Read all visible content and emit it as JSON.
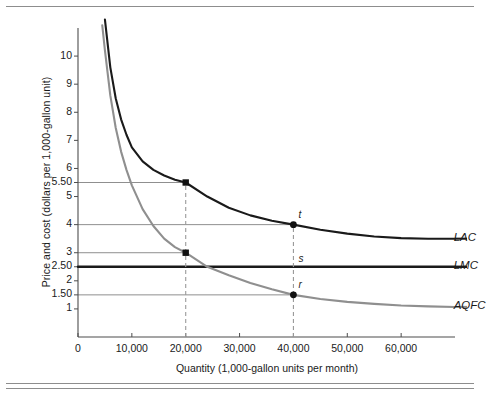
{
  "chart_data": {
    "type": "line",
    "title": "",
    "xlabel": "Quantity (1,000-gallon units per month)",
    "ylabel": "Price and cost (dollars per 1,000-gallon unit)",
    "xlim": [
      0,
      70000
    ],
    "ylim": [
      0,
      11
    ],
    "grid": false,
    "legend_position": "right-of-curves",
    "x_ticks": [
      "0",
      "10,000",
      "20,000",
      "30,000",
      "40,000",
      "50,000",
      "60,000"
    ],
    "x_tick_values": [
      0,
      10000,
      20000,
      30000,
      40000,
      50000,
      60000
    ],
    "y_ticks": [
      "1",
      "1.50",
      "2",
      "2.50",
      "3",
      "4",
      "5",
      "5.50",
      "6",
      "7",
      "8",
      "9",
      "10"
    ],
    "y_tick_values": [
      1,
      1.5,
      2,
      2.5,
      3,
      4,
      5,
      5.5,
      6,
      7,
      8,
      9,
      10
    ],
    "series": [
      {
        "name": "LAC",
        "label": "LAC",
        "color": "#1a1a1a",
        "width": 2.1,
        "points": [
          [
            5000,
            11.3
          ],
          [
            6000,
            9.6
          ],
          [
            7000,
            8.5
          ],
          [
            8000,
            7.75
          ],
          [
            9000,
            7.2
          ],
          [
            10000,
            6.75
          ],
          [
            12000,
            6.25
          ],
          [
            14000,
            5.95
          ],
          [
            16000,
            5.75
          ],
          [
            18000,
            5.6
          ],
          [
            20000,
            5.5
          ],
          [
            24000,
            5.0
          ],
          [
            28000,
            4.6
          ],
          [
            32000,
            4.33
          ],
          [
            36000,
            4.14
          ],
          [
            40000,
            4.0
          ],
          [
            45000,
            3.82
          ],
          [
            50000,
            3.68
          ],
          [
            55000,
            3.58
          ],
          [
            60000,
            3.52
          ],
          [
            65000,
            3.5
          ],
          [
            70000,
            3.5
          ]
        ]
      },
      {
        "name": "LMC",
        "label": "LMC",
        "color": "#1a1a1a",
        "width": 2.4,
        "points": [
          [
            0,
            2.5
          ],
          [
            70000,
            2.5
          ]
        ]
      },
      {
        "name": "AQFC",
        "label": "AQFC",
        "color": "#8f8f8f",
        "width": 2.1,
        "points": [
          [
            4500,
            11.1
          ],
          [
            5000,
            10.2
          ],
          [
            6000,
            8.6
          ],
          [
            7000,
            7.45
          ],
          [
            8000,
            6.6
          ],
          [
            9000,
            5.95
          ],
          [
            10000,
            5.4
          ],
          [
            12000,
            4.55
          ],
          [
            14000,
            3.95
          ],
          [
            16000,
            3.5
          ],
          [
            18000,
            3.2
          ],
          [
            20000,
            3.0
          ],
          [
            24000,
            2.5
          ],
          [
            28000,
            2.2
          ],
          [
            32000,
            1.92
          ],
          [
            36000,
            1.7
          ],
          [
            40000,
            1.5
          ],
          [
            45000,
            1.35
          ],
          [
            50000,
            1.25
          ],
          [
            55000,
            1.18
          ],
          [
            60000,
            1.12
          ],
          [
            65000,
            1.09
          ],
          [
            70000,
            1.07
          ]
        ]
      }
    ],
    "markers": [
      {
        "label": "",
        "x": 20000,
        "y": 5.5,
        "shape": "square",
        "color": "#111111",
        "series": "LAC"
      },
      {
        "label": "",
        "x": 20000,
        "y": 3.0,
        "shape": "square",
        "color": "#111111",
        "series": "AQFC"
      },
      {
        "label": "t",
        "x": 40000,
        "y": 4.0,
        "shape": "circle",
        "color": "#111111",
        "series": "LAC"
      },
      {
        "label": "s",
        "x": 40000,
        "y": 2.5,
        "shape": "none",
        "color": "#111111",
        "series": "LMC"
      },
      {
        "label": "r",
        "x": 40000,
        "y": 1.5,
        "shape": "circle",
        "color": "#111111",
        "series": "AQFC"
      }
    ],
    "guide_lines_horizontal": [
      {
        "y": 5.5,
        "from_x": 0,
        "to_x": 20000,
        "color": "#8f8f8f"
      },
      {
        "y": 4.0,
        "from_x": 0,
        "to_x": 40000,
        "color": "#8f8f8f"
      },
      {
        "y": 3.0,
        "from_x": 0,
        "to_x": 20000,
        "color": "#8f8f8f"
      },
      {
        "y": 1.5,
        "from_x": 0,
        "to_x": 40000,
        "color": "#8f8f8f"
      }
    ],
    "guide_lines_vertical": [
      {
        "x": 20000,
        "from_y": 0,
        "to_y": 5.5,
        "style": "dashed",
        "color": "#9a9a9a"
      },
      {
        "x": 40000,
        "from_y": 0,
        "to_y": 4.0,
        "style": "dashed",
        "color": "#9a9a9a"
      }
    ],
    "annotations": [
      {
        "text": "LAC",
        "x": 70500,
        "y": 3.5
      },
      {
        "text": "LMC",
        "x": 70500,
        "y": 2.5
      },
      {
        "text": "AQFC",
        "x": 70500,
        "y": 1.07
      }
    ]
  },
  "axis": {
    "x_title": "Quantity (1,000-gallon units per month)",
    "y_title": "Price and cost (dollars per 1,000-gallon unit)"
  },
  "curve_labels": {
    "lac": "LAC",
    "lmc": "LMC",
    "aqfc": "AQFC"
  },
  "point_labels": {
    "t": "t",
    "s": "s",
    "r": "r"
  },
  "colors": {
    "curve_dark": "#1a1a1a",
    "curve_gray": "#8f8f8f",
    "guide_gray": "#8f8f8f",
    "dash_gray": "#9a9a9a",
    "rule": "#8d8d8d",
    "axis": "#4d4d4d"
  }
}
